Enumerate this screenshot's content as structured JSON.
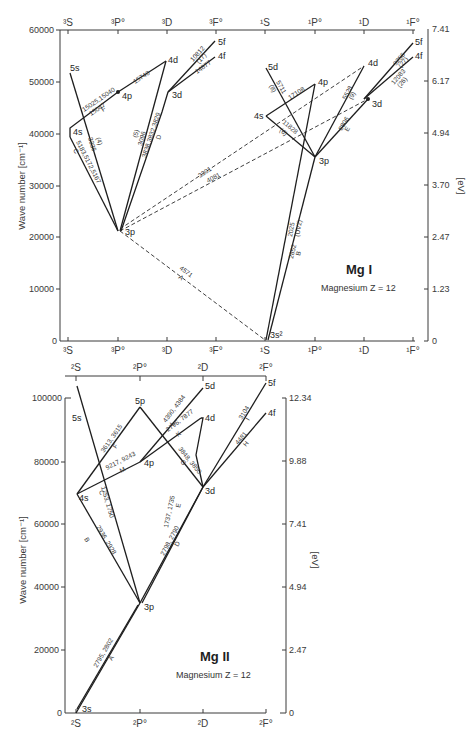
{
  "mg1": {
    "title": "Mg I",
    "subtitle": "Magnesium  Z = 12",
    "y_axis_label": "Wave number [cm⁻¹]",
    "ev_axis_label": "[eV]",
    "y_ticks": [
      "60000",
      "50000",
      "40000",
      "30000",
      "20000",
      "10000",
      "0"
    ],
    "ev_ticks": [
      "7.41",
      "6.17",
      "4.94",
      "3.70",
      "2.47",
      "1.23",
      "0"
    ],
    "columns_top": [
      "³S",
      "³P°",
      "³D",
      "³F°",
      "¹S",
      "¹P°",
      "¹D",
      "¹F°"
    ],
    "columns_bottom": [
      "³S",
      "³P°",
      "³D",
      "³F°",
      "¹S",
      "¹P°",
      "¹D",
      "¹F°"
    ],
    "levels": {
      "t5s": "5s",
      "t4s": "4s",
      "t4p": "4p",
      "t3p": "3p",
      "t4d": "4d",
      "t3d": "3d",
      "t5f": "5f",
      "t4f": "4f",
      "s5d": "5d",
      "s4s": "4s",
      "s4p": "4p",
      "s3p": "3p",
      "s4d": "4d",
      "s3d": "3d",
      "s5f": "5f",
      "s4f": "4f",
      "ground": "3s²"
    },
    "lines": {
      "f1": "15025,15040",
      "f2": "15047",
      "f3": "F",
      "f4": "15740",
      "c1": "5183,5172,5167",
      "c2": "C",
      "u1": "3336",
      "u2": "(4)",
      "d1": "3838,3832,3829",
      "d2": "D",
      "d3": "3096",
      "d4": "(5)",
      "h1": "10812",
      "h2": "(17)",
      "h3": "14877",
      "l1": "3301",
      "l2": "4081",
      "a1": "4571",
      "a2": "A",
      "s1": "5711",
      "s2": "(8)",
      "s3": "11828",
      "s4": "(6)",
      "s5": "17108",
      "s6": "5528",
      "s7": "(9)",
      "s8": "8806",
      "s9": "E",
      "s10": "9256",
      "s11": "(27)",
      "s12": "12083",
      "s13": "(26)",
      "b1": "2025",
      "b2": "(UV2)",
      "b3": "2852",
      "b4": "B"
    }
  },
  "mg2": {
    "title": "Mg II",
    "subtitle": "Magnesium   Z = 12",
    "y_axis_label": "Wave number [cm⁻¹]",
    "ev_axis_label": "[eV]",
    "y_ticks": [
      "100000",
      "80000",
      "60000",
      "40000",
      "20000",
      "0"
    ],
    "ev_ticks": [
      "12.34",
      "9.88",
      "7.41",
      "4.94",
      "2.47",
      "0"
    ],
    "columns_top": [
      "²S",
      "²P°",
      "²D",
      "²F°"
    ],
    "columns_bottom": [
      "²S",
      "²P°",
      "²D",
      "²F°"
    ],
    "levels": {
      "l5s": "5s",
      "l4s": "4s",
      "l5p": "5p",
      "l4p": "4p",
      "l3p": "3p",
      "l5d": "5d",
      "l4d": "4d",
      "l3d": "3d",
      "l5f": "5f",
      "l4f": "4f",
      "l3s": "3s"
    },
    "lines": {
      "a1": "2795, 2802",
      "a2": "A",
      "b1": "2936, 2928",
      "b2": "B",
      "c1": "1753, 1750",
      "c2": "C",
      "d1": "2798, 2790",
      "d2": "D",
      "e1": "1737, 1735",
      "e2": "E",
      "f1": "3613, 3615",
      "f2": "F",
      "g1": "3848, 3850",
      "g2": "G",
      "h1": "4481",
      "h2": "H",
      "i1": "3104",
      "i2": "I",
      "k1": "2796, 7877",
      "k2": "K",
      "l1": "4390, 4384",
      "l2": "L",
      "m1": "9217, 9243",
      "m2": "M"
    }
  }
}
